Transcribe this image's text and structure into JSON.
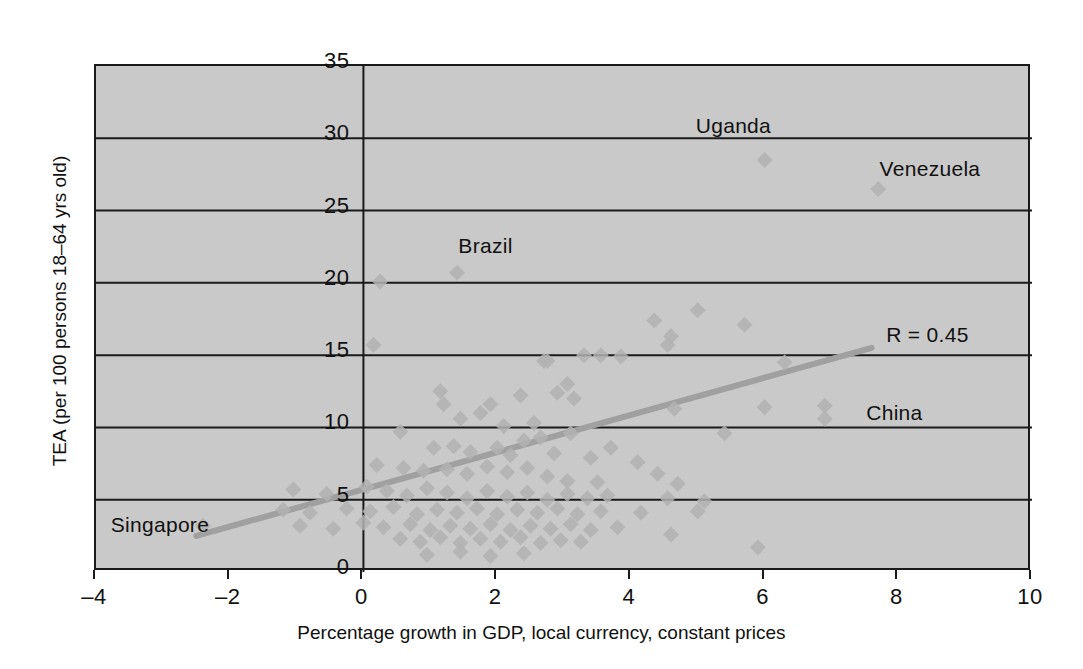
{
  "chart_data": {
    "type": "scatter",
    "title": "",
    "xlabel": "Percentage growth in GDP, local currency, constant prices",
    "ylabel": "TEA (per 100 persons 18–64 yrs old)",
    "xlim": [
      -4,
      10
    ],
    "ylim": [
      0,
      35
    ],
    "xticks": [
      -4,
      -2,
      0,
      2,
      4,
      6,
      8,
      10
    ],
    "yticks": [
      0,
      5,
      10,
      15,
      20,
      25,
      30,
      35
    ],
    "xtick_labels": [
      "–4",
      "–2",
      "0",
      "2",
      "4",
      "6",
      "8",
      "10"
    ],
    "ytick_labels": [
      "0",
      "5",
      "10",
      "15",
      "20",
      "25",
      "30",
      "35"
    ],
    "grid": "horizontal",
    "gridlines_y": [
      5,
      10,
      15,
      20,
      25,
      30
    ],
    "legend": "none",
    "plot_background": "#c9c9c9",
    "marker_color": "#b2b2b2",
    "marker_shape": "diamond",
    "trendline_color": "#a0a0a0",
    "correlation_label": "R = 0.45",
    "correlation": 0.45,
    "trendline": {
      "x0": -2.5,
      "y0": 2.5,
      "x1": 7.6,
      "y1": 15.5
    },
    "annotations": [
      {
        "text": "Uganda",
        "x": 5.0,
        "y": 30.6
      },
      {
        "text": "Venezuela",
        "x": 7.75,
        "y": 27.6
      },
      {
        "text": "Brazil",
        "x": 1.45,
        "y": 22.3
      },
      {
        "text": "R = 0.45",
        "x": 7.85,
        "y": 16.1
      },
      {
        "text": "China",
        "x": 7.55,
        "y": 10.7
      },
      {
        "text": "Singapore",
        "x": -3.75,
        "y": 3.0
      }
    ],
    "points": [
      [
        6.0,
        28.5
      ],
      [
        7.7,
        26.5
      ],
      [
        1.4,
        20.7
      ],
      [
        0.25,
        20.1
      ],
      [
        0.15,
        15.7
      ],
      [
        4.6,
        16.3
      ],
      [
        5.0,
        18.1
      ],
      [
        4.35,
        17.4
      ],
      [
        5.7,
        17.1
      ],
      [
        3.85,
        14.9
      ],
      [
        3.3,
        15.0
      ],
      [
        3.55,
        15.0
      ],
      [
        2.7,
        14.6
      ],
      [
        2.75,
        14.6
      ],
      [
        6.3,
        14.5
      ],
      [
        4.55,
        15.7
      ],
      [
        3.05,
        13.0
      ],
      [
        2.9,
        12.4
      ],
      [
        3.15,
        12.0
      ],
      [
        2.35,
        12.2
      ],
      [
        4.65,
        11.3
      ],
      [
        6.0,
        11.4
      ],
      [
        6.9,
        11.5
      ],
      [
        6.9,
        10.6
      ],
      [
        1.15,
        12.5
      ],
      [
        1.2,
        11.6
      ],
      [
        1.75,
        11.0
      ],
      [
        1.9,
        11.6
      ],
      [
        1.45,
        10.6
      ],
      [
        2.1,
        10.1
      ],
      [
        2.55,
        10.3
      ],
      [
        0.55,
        9.7
      ],
      [
        3.1,
        9.6
      ],
      [
        5.4,
        9.6
      ],
      [
        2.4,
        9.1
      ],
      [
        2.65,
        9.3
      ],
      [
        1.05,
        8.6
      ],
      [
        1.35,
        8.7
      ],
      [
        1.6,
        8.3
      ],
      [
        2.0,
        8.6
      ],
      [
        2.2,
        8.1
      ],
      [
        2.85,
        8.2
      ],
      [
        3.4,
        7.9
      ],
      [
        3.7,
        8.6
      ],
      [
        4.1,
        7.6
      ],
      [
        0.2,
        7.4
      ],
      [
        0.6,
        7.2
      ],
      [
        0.9,
        7.0
      ],
      [
        1.25,
        7.1
      ],
      [
        1.55,
        6.8
      ],
      [
        1.85,
        7.3
      ],
      [
        2.15,
        6.9
      ],
      [
        2.45,
        7.2
      ],
      [
        2.75,
        6.6
      ],
      [
        3.05,
        6.3
      ],
      [
        3.5,
        6.2
      ],
      [
        4.4,
        6.8
      ],
      [
        4.7,
        6.1
      ],
      [
        -1.05,
        5.7
      ],
      [
        -0.55,
        5.4
      ],
      [
        0.05,
        5.9
      ],
      [
        0.35,
        5.6
      ],
      [
        0.65,
        5.3
      ],
      [
        0.95,
        5.8
      ],
      [
        1.25,
        5.5
      ],
      [
        1.55,
        5.1
      ],
      [
        1.85,
        5.6
      ],
      [
        2.15,
        5.2
      ],
      [
        2.45,
        5.5
      ],
      [
        2.75,
        5.0
      ],
      [
        3.05,
        5.4
      ],
      [
        3.35,
        5.1
      ],
      [
        3.65,
        5.3
      ],
      [
        4.55,
        5.1
      ],
      [
        5.1,
        4.9
      ],
      [
        -1.2,
        4.3
      ],
      [
        -0.8,
        4.1
      ],
      [
        -0.25,
        4.4
      ],
      [
        0.1,
        4.2
      ],
      [
        0.45,
        4.5
      ],
      [
        0.8,
        4.0
      ],
      [
        1.1,
        4.3
      ],
      [
        1.4,
        4.1
      ],
      [
        1.7,
        4.4
      ],
      [
        2.0,
        4.0
      ],
      [
        2.3,
        4.3
      ],
      [
        2.6,
        4.1
      ],
      [
        2.9,
        4.4
      ],
      [
        3.2,
        4.0
      ],
      [
        3.55,
        4.2
      ],
      [
        4.15,
        4.1
      ],
      [
        5.0,
        4.2
      ],
      [
        -0.95,
        3.2
      ],
      [
        -0.45,
        3.0
      ],
      [
        0.0,
        3.4
      ],
      [
        0.3,
        3.1
      ],
      [
        0.7,
        3.3
      ],
      [
        1.0,
        2.9
      ],
      [
        1.3,
        3.2
      ],
      [
        1.6,
        3.0
      ],
      [
        1.9,
        3.3
      ],
      [
        2.2,
        2.9
      ],
      [
        2.5,
        3.2
      ],
      [
        2.8,
        3.0
      ],
      [
        3.1,
        3.3
      ],
      [
        3.4,
        2.9
      ],
      [
        3.8,
        3.1
      ],
      [
        4.6,
        2.6
      ],
      [
        -2.4,
        3.2
      ],
      [
        0.55,
        2.3
      ],
      [
        0.85,
        2.1
      ],
      [
        1.15,
        2.4
      ],
      [
        1.45,
        2.0
      ],
      [
        1.75,
        2.3
      ],
      [
        2.05,
        2.1
      ],
      [
        2.35,
        2.4
      ],
      [
        2.65,
        2.0
      ],
      [
        2.95,
        2.2
      ],
      [
        3.25,
        2.1
      ],
      [
        5.9,
        1.7
      ],
      [
        0.95,
        1.2
      ],
      [
        1.45,
        1.4
      ],
      [
        1.9,
        1.1
      ],
      [
        2.4,
        1.3
      ]
    ]
  }
}
